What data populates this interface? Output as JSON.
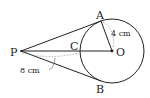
{
  "diagram": {
    "points": {
      "P": {
        "label": "P",
        "x": 21,
        "y": 51
      },
      "A": {
        "label": "A",
        "x": 101,
        "y": 21
      },
      "B": {
        "label": "B",
        "x": 101,
        "y": 81
      },
      "C": {
        "label": "C",
        "x": 80,
        "y": 51
      },
      "O": {
        "label": "O",
        "x": 112,
        "y": 51
      }
    },
    "circle": {
      "center": "O",
      "radius": 32
    },
    "measurements": {
      "radius_label": "4 cm",
      "pc_label": "8 cm"
    },
    "colors": {
      "line": "#222222",
      "dashed": "#999999"
    }
  }
}
